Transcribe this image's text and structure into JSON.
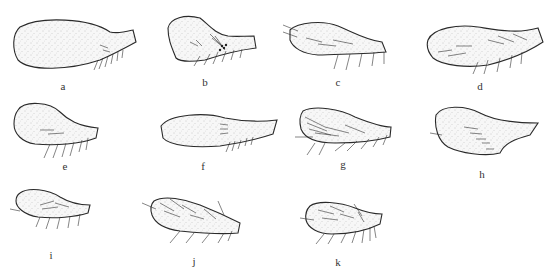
{
  "figure": {
    "panels": [
      {
        "id": "a",
        "label": "a"
      },
      {
        "id": "b",
        "label": "b"
      },
      {
        "id": "c",
        "label": "c"
      },
      {
        "id": "d",
        "label": "d"
      },
      {
        "id": "e",
        "label": "e"
      },
      {
        "id": "f",
        "label": "f"
      },
      {
        "id": "g",
        "label": "g"
      },
      {
        "id": "h",
        "label": "h"
      },
      {
        "id": "i",
        "label": "i"
      },
      {
        "id": "j",
        "label": "j"
      },
      {
        "id": "k",
        "label": "k"
      }
    ]
  }
}
